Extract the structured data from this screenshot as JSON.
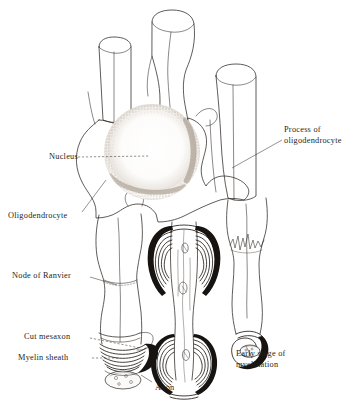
{
  "figure": {
    "ink_color": "#2b2622",
    "paper_color": "#ffffff"
  },
  "labels": [
    {
      "id": "nucleus",
      "text": "Nucleus",
      "x": 16,
      "y": 152,
      "align": "right",
      "width": 62
    },
    {
      "id": "oligodendrocyte",
      "text": "Oligodendrocyte",
      "x": 8,
      "y": 211,
      "align": "left",
      "width": 80
    },
    {
      "id": "node-of-ranvier",
      "text": "Node of Ranvier",
      "x": 12,
      "y": 271,
      "align": "left",
      "width": 78
    },
    {
      "id": "cut-mesaxon",
      "text": "Cut mesaxon",
      "x": 24,
      "y": 332,
      "align": "left",
      "width": 64
    },
    {
      "id": "myelin-sheath",
      "text": "Myelin sheath",
      "x": 18,
      "y": 353,
      "align": "left",
      "width": 70
    },
    {
      "id": "axon",
      "text": "Axon",
      "x": 155,
      "y": 383,
      "align": "left",
      "width": 30
    }
  ],
  "labels_multiline": [
    {
      "id": "process-of-oligodendrocyte",
      "line1": "Process of",
      "line2": "oligodendrocyte",
      "x": 284,
      "y": 125
    },
    {
      "id": "early-stage-of-myelination",
      "line1": "Early stage of",
      "line2": "myelination",
      "x": 236,
      "y": 349
    }
  ],
  "parts": [
    {
      "id": "cell-body",
      "name": "oligodendrocyte-cell-body"
    },
    {
      "id": "nucleus-stipple",
      "name": "nucleus"
    },
    {
      "id": "axon-left",
      "name": "myelinated-axon-left"
    },
    {
      "id": "axon-center",
      "name": "unrolled-myelin-axon-center"
    },
    {
      "id": "axon-right",
      "name": "myelinated-axon-right"
    },
    {
      "id": "axon-top-left",
      "name": "cut-axon-top-left"
    },
    {
      "id": "axon-top-mid",
      "name": "cut-axon-top-middle"
    },
    {
      "id": "cut-face",
      "name": "cut-axon-face-left"
    },
    {
      "id": "spiral-early",
      "name": "early-myelination-spiral"
    },
    {
      "id": "node-constriction",
      "name": "node-of-ranvier-constriction"
    }
  ]
}
